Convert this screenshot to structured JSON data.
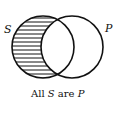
{
  "diagram": {
    "type": "venn",
    "sets": [
      {
        "label": "S",
        "cx": 43,
        "cy": 47,
        "r": 31,
        "shaded_region": "S minus P"
      },
      {
        "label": "P",
        "cx": 72,
        "cy": 47,
        "r": 31
      }
    ],
    "caption": {
      "prefix": "All ",
      "subject": "S",
      "middle": " are ",
      "predicate": "P"
    },
    "colors": {
      "stroke": "#111111",
      "hatch": "#111111",
      "background": "#ffffff"
    }
  }
}
